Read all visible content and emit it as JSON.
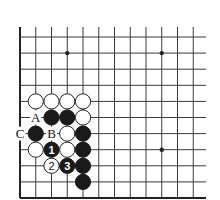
{
  "diagram": {
    "type": "go-board-fragment",
    "board_edges": [
      "left",
      "bottom"
    ],
    "columns": 12,
    "rows": 11,
    "star_points": [
      {
        "col": 3,
        "row": 1
      },
      {
        "col": 9,
        "row": 1
      },
      {
        "col": 9,
        "row": 7
      }
    ],
    "stones": [
      {
        "col": 1,
        "row": 4,
        "color": "white"
      },
      {
        "col": 2,
        "row": 4,
        "color": "white"
      },
      {
        "col": 3,
        "row": 4,
        "color": "white"
      },
      {
        "col": 4,
        "row": 4,
        "color": "white"
      },
      {
        "col": 2,
        "row": 5,
        "color": "black"
      },
      {
        "col": 3,
        "row": 5,
        "color": "black"
      },
      {
        "col": 4,
        "row": 5,
        "color": "white"
      },
      {
        "col": 1,
        "row": 6,
        "color": "black"
      },
      {
        "col": 3,
        "row": 6,
        "color": "white"
      },
      {
        "col": 4,
        "row": 6,
        "color": "black"
      },
      {
        "col": 1,
        "row": 7,
        "color": "white"
      },
      {
        "col": 2,
        "row": 7,
        "color": "black",
        "number": "1"
      },
      {
        "col": 3,
        "row": 7,
        "color": "white"
      },
      {
        "col": 4,
        "row": 7,
        "color": "black"
      },
      {
        "col": 2,
        "row": 8,
        "color": "white",
        "number": "2"
      },
      {
        "col": 3,
        "row": 8,
        "color": "black",
        "number": "3"
      },
      {
        "col": 4,
        "row": 8,
        "color": "black"
      },
      {
        "col": 4,
        "row": 9,
        "color": "black"
      }
    ],
    "labels": [
      {
        "col": 1,
        "row": 5,
        "text": "A"
      },
      {
        "col": 2,
        "row": 6,
        "text": "B"
      },
      {
        "col": 0,
        "row": 6,
        "text": "C"
      }
    ],
    "colors": {
      "black_stone": "#1a1a1a",
      "white_stone": "#ffffff",
      "line": "#3a3a3a"
    }
  }
}
